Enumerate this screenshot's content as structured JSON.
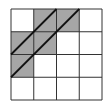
{
  "grid": {
    "rows": 4,
    "cols": 4,
    "origin": [
      11,
      9
    ],
    "cell_size": 22.75,
    "line_color": "#333333",
    "shade_color": "#a6a6a6",
    "shaded_cells": [
      [
        0,
        1
      ],
      [
        0,
        2
      ],
      [
        1,
        0
      ],
      [
        1,
        1
      ],
      [
        2,
        0
      ]
    ]
  },
  "diagonals": [
    {
      "from": [
        11,
        54.5
      ],
      "to": [
        56.5,
        9
      ]
    },
    {
      "from": [
        11,
        77.25
      ],
      "to": [
        79.25,
        9
      ]
    }
  ]
}
